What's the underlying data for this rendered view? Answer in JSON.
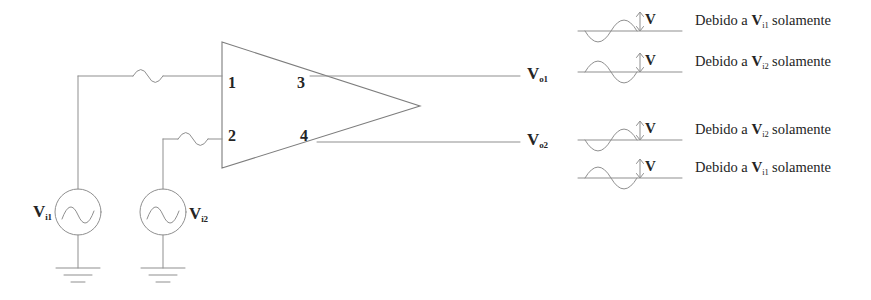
{
  "figure": {
    "type": "differential-amplifier-schematic",
    "line_color": "#8a8a8a",
    "text_color": "#242424",
    "background": "#ffffff"
  },
  "amplifier": {
    "name": "difference-amplifier",
    "pins": [
      {
        "number": "1",
        "role": "input-1"
      },
      {
        "number": "2",
        "role": "input-2"
      },
      {
        "number": "3",
        "role": "output-1"
      },
      {
        "number": "4",
        "role": "output-2"
      }
    ]
  },
  "sources": [
    {
      "label_v": "V",
      "label_sub": "i1",
      "icon": "ac-source-icon"
    },
    {
      "label_v": "V",
      "label_sub": "i2",
      "icon": "ac-source-icon"
    }
  ],
  "outputs": [
    {
      "label_v": "V",
      "label_sub": "o1"
    },
    {
      "label_v": "V",
      "label_sub": "o2"
    }
  ],
  "waveform_rows": [
    {
      "group": "Vo1",
      "phase": "inverted",
      "amplitude_label": "V",
      "caption_prefix": "Debido a ",
      "caption_v": "V",
      "caption_sub": "i1",
      "caption_suffix": " solamente"
    },
    {
      "group": "Vo1",
      "phase": "normal",
      "amplitude_label": "V",
      "caption_prefix": "Debido a ",
      "caption_v": "V",
      "caption_sub": "i2",
      "caption_suffix": " solamente"
    },
    {
      "group": "Vo2",
      "phase": "inverted",
      "amplitude_label": "V",
      "caption_prefix": "Debido a ",
      "caption_v": "V",
      "caption_sub": "i2",
      "caption_suffix": " solamente"
    },
    {
      "group": "Vo2",
      "phase": "normal",
      "amplitude_label": "V",
      "caption_prefix": "Debido a ",
      "caption_v": "V",
      "caption_sub": "i1",
      "caption_suffix": " solamente"
    }
  ]
}
